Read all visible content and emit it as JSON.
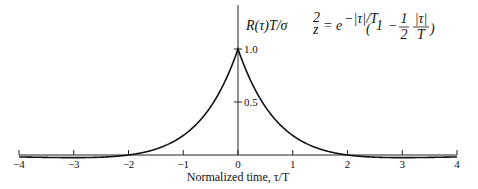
{
  "chart_data": {
    "type": "line",
    "title": "",
    "formula": {
      "lhs": "R(τ)T/σ",
      "lhs_sup": "2",
      "lhs_sub": "z",
      "eq": "=",
      "base": "e",
      "exp": "−|τ|/T",
      "paren_open": "(",
      "one": "1",
      "minus": "−",
      "frac1_num": "1",
      "frac1_den": "2",
      "frac2_num": "|τ|",
      "frac2_den": "T",
      "paren_close": ")"
    },
    "xlabel": "Normalized time, τ/T",
    "ylabel": "",
    "xlim": [
      -4,
      4
    ],
    "ylim": [
      0,
      1.0
    ],
    "x_ticks": [
      -4,
      -3,
      -2,
      -1,
      0,
      1,
      2,
      3,
      4
    ],
    "x_tick_labels": [
      "−4",
      "−3",
      "−2",
      "−1",
      "0",
      "1",
      "2",
      "3",
      "4"
    ],
    "y_ticks": [
      0.5,
      1.0
    ],
    "y_tick_labels": [
      "0.5",
      "1.0"
    ],
    "grid": false,
    "series": [
      {
        "name": "R(τ)T/σz² = e^(−|τ|/T)(1 − ½|τ|/T)",
        "function": "exp(-|x|)*(1-0.5*|x|)",
        "x": [
          -4,
          -3.5,
          -3,
          -2.5,
          -2,
          -1.5,
          -1,
          -0.5,
          0,
          0.5,
          1,
          1.5,
          2,
          2.5,
          3,
          3.5,
          4
        ],
        "values": [
          -0.018,
          -0.0226,
          -0.0249,
          -0.0205,
          0,
          0.0558,
          0.1839,
          0.4549,
          1.0,
          0.4549,
          0.1839,
          0.0558,
          0,
          -0.0205,
          -0.0249,
          -0.0226,
          -0.018
        ]
      }
    ]
  }
}
